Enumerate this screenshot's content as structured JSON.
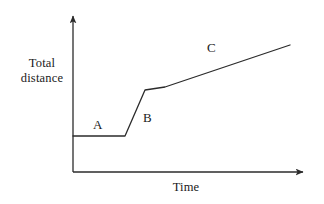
{
  "chart_data": {
    "type": "line",
    "title": "",
    "subtitle": "",
    "xlabel": "Time",
    "ylabel": "Total distance",
    "ylabel_lines": [
      "Total",
      "distance"
    ],
    "grid": false,
    "legend": "none",
    "axes": {
      "x_axis_arrow": true,
      "y_axis_arrow": true,
      "x_ticks": [],
      "y_ticks": [],
      "xlim": [
        0,
        10
      ],
      "ylim": [
        0,
        10
      ]
    },
    "annotations": [
      {
        "text": "A",
        "x": 1.6,
        "y": 2.6,
        "describes": "flat segment, no change in total distance"
      },
      {
        "text": "B",
        "x": 3.7,
        "y": 3.9,
        "describes": "steep rise, rapid increase in total distance"
      },
      {
        "text": "C",
        "x": 6.8,
        "y": 7.8,
        "describes": "gentle steady rise in total distance"
      }
    ],
    "series": [
      {
        "name": "Total distance over time",
        "color": "#2b2b2b",
        "points": [
          {
            "x": 0.0,
            "y": 2.1,
            "segment": "A"
          },
          {
            "x": 2.3,
            "y": 2.1,
            "segment": "A"
          },
          {
            "x": 3.1,
            "y": 4.9,
            "segment": "B"
          },
          {
            "x": 3.95,
            "y": 5.1,
            "segment": "B-C junction"
          },
          {
            "x": 9.25,
            "y": 7.9,
            "segment": "C"
          }
        ]
      }
    ]
  },
  "geometry": {
    "origin": {
      "x": 73,
      "y": 172
    },
    "y_axis_top": {
      "x": 73,
      "y": 13
    },
    "x_axis_right": {
      "x": 308,
      "y": 172
    },
    "path_points": [
      {
        "x": 73,
        "y": 136
      },
      {
        "x": 125,
        "y": 136
      },
      {
        "x": 145,
        "y": 90
      },
      {
        "x": 165,
        "y": 87
      },
      {
        "x": 290,
        "y": 45
      }
    ]
  },
  "style": {
    "background": "#ffffff",
    "stroke": "#2b2b2b",
    "text_color": "#1a1a1a"
  }
}
